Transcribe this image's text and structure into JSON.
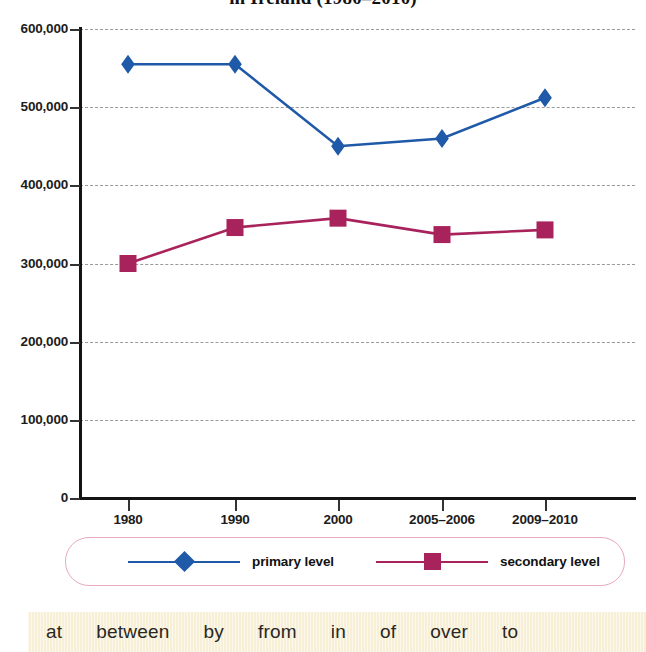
{
  "chart_data": {
    "type": "line",
    "title": "in Ireland (1980–2010)",
    "xlabel": "",
    "ylabel": "",
    "categories": [
      "1980",
      "1990",
      "2000",
      "2005–2006",
      "2009–2010"
    ],
    "series": [
      {
        "name": "primary level",
        "marker": "diamond",
        "color": "#1f5aa8",
        "values": [
          555000,
          555000,
          450000,
          460000,
          512000
        ]
      },
      {
        "name": "secondary level",
        "marker": "square",
        "color": "#a8235c",
        "values": [
          300000,
          346000,
          358000,
          337000,
          343000
        ]
      }
    ],
    "ylim": [
      0,
      600000
    ],
    "y_ticks": [
      "0",
      "100,000",
      "200,000",
      "300,000",
      "400,000",
      "500,000",
      "600,000"
    ],
    "y_tick_values": [
      0,
      100000,
      200000,
      300000,
      400000,
      500000,
      600000
    ],
    "grid": true,
    "legend_position": "bottom"
  },
  "legend": {
    "entries": [
      {
        "label": "primary level",
        "color": "#1f5aa8",
        "marker": "diamond"
      },
      {
        "label": "secondary level",
        "color": "#a8235c",
        "marker": "square"
      }
    ]
  },
  "word_bank": {
    "words": [
      "at",
      "between",
      "by",
      "from",
      "in",
      "of",
      "over",
      "to"
    ]
  },
  "colors": {
    "primary": "#1f5aa8",
    "secondary": "#a8235c",
    "gridline": "#9a9a9a",
    "axis": "#141414",
    "legend_border": "#e8a9bb",
    "word_bank_background": "#f7efd6"
  }
}
